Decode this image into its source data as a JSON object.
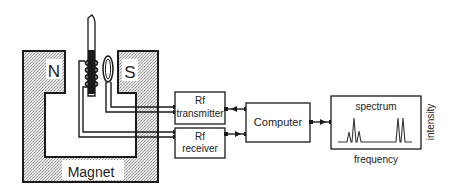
{
  "diagram": {
    "magnet": {
      "label": "Magnet",
      "north_label": "N",
      "south_label": "S"
    },
    "blocks": {
      "transmitter": {
        "line1": "Rf",
        "line2": "transmitter"
      },
      "receiver": {
        "line1": "Rf",
        "line2": "receiver"
      },
      "computer": {
        "label": "Computer"
      },
      "spectrum": {
        "label": "spectrum",
        "x_axis": "frequency",
        "y_axis": "intensity"
      }
    },
    "colors": {
      "stroke": "#1a1a1a",
      "magnet_fill": "#cfcfcf",
      "background": "#ffffff"
    }
  }
}
